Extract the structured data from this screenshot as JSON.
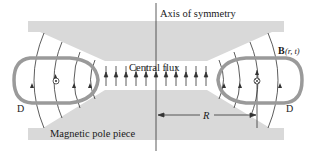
{
  "diagram": {
    "labels": {
      "axis": "Axis of symmetry",
      "central_flux": "Central flux",
      "field_bold": "B",
      "field_args": "(r, t)",
      "pole_piece": "Magnetic pole piece",
      "radius": "R",
      "d_left": "D",
      "d_right": "D"
    },
    "symbols": {
      "left_loop_current": "dot-out-of-page",
      "right_loop_current": "cross-into-page"
    },
    "colors": {
      "pole_piece": "#d9d9d9",
      "loop": "#9a9a9a",
      "field_line": "#333333",
      "text": "#1a1a1a",
      "background": "#ffffff"
    },
    "central_flux_arrow_count": 11
  }
}
